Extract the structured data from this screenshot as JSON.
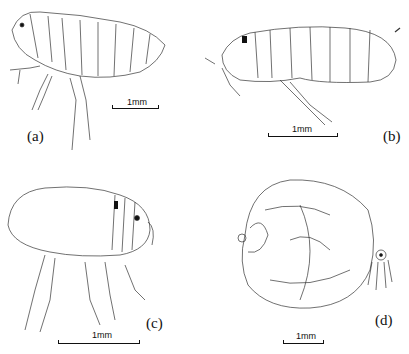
{
  "figure": {
    "panels": [
      {
        "id": "a",
        "label": "(a)",
        "subject": "flea lateral view (male-like, slender)",
        "scale_bar": "1mm"
      },
      {
        "id": "b",
        "label": "(b)",
        "subject": "flea lateral view (elongated body)",
        "scale_bar": "1mm"
      },
      {
        "id": "c",
        "label": "(c)",
        "subject": "flea lateral view (gravid, swollen abdomen)",
        "scale_bar": "1mm"
      },
      {
        "id": "d",
        "label": "(d)",
        "subject": "neosomic female flea (hypertrophied abdomen)",
        "scale_bar": "1mm"
      }
    ],
    "colors": {
      "line": "#222222",
      "background": "#ffffff"
    }
  }
}
